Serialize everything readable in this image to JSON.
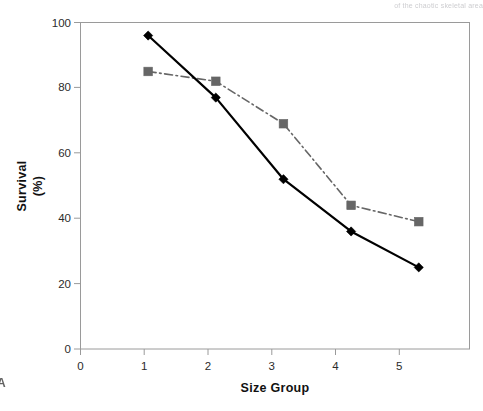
{
  "figure": {
    "panel_letter": "A",
    "bleed_through_text": "of the chaotic skeletal area"
  },
  "chart_data": {
    "type": "line",
    "title": "",
    "xlabel": "Size Group",
    "ylabel": "Survival\n(%)",
    "ylabel_line1": "Survival",
    "ylabel_line2": "(%)",
    "x": [
      1,
      2,
      3,
      4,
      5
    ],
    "categories": [
      "1",
      "2",
      "3",
      "4",
      "5"
    ],
    "xtick_labels": [
      "0",
      "1",
      "2",
      "3",
      "4",
      "5"
    ],
    "xticks": [
      0,
      1,
      2,
      3,
      4,
      5
    ],
    "ytick_labels": [
      "0",
      "20",
      "40",
      "60",
      "80",
      "100"
    ],
    "yticks": [
      0,
      20,
      40,
      60,
      80,
      100
    ],
    "xlim": [
      0,
      5.75
    ],
    "ylim": [
      0,
      100
    ],
    "grid": false,
    "legend": "none",
    "series": [
      {
        "name": "Series 1",
        "marker": "diamond",
        "line_style": "solid",
        "color": "#000000",
        "values": [
          96,
          77,
          52,
          36,
          25
        ]
      },
      {
        "name": "Series 2",
        "marker": "square",
        "line_style": "dashdot",
        "color": "#666666",
        "values": [
          85,
          82,
          69,
          44,
          39
        ]
      }
    ]
  },
  "colors": {
    "series1": "#000000",
    "series2": "#666666",
    "axis": "#999999",
    "text": "#1a1a1a",
    "background": "#ffffff"
  }
}
